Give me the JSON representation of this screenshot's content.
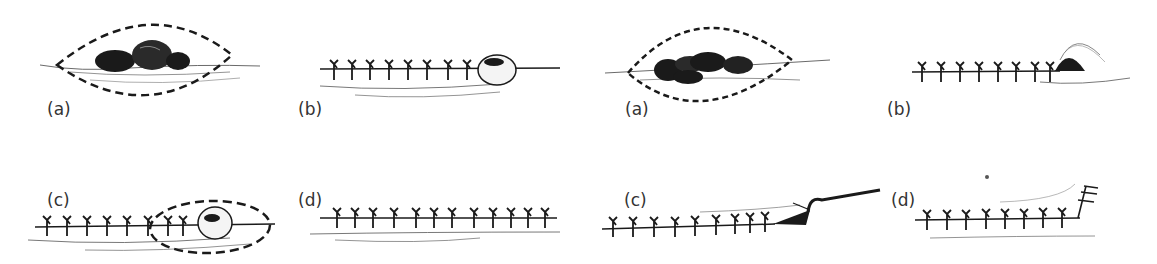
{
  "figure": {
    "sets": [
      {
        "name": "left-series",
        "panels": [
          {
            "id": "a",
            "label": "(a)",
            "description": "Dark lobulated mass with dashed elliptical excision outline"
          },
          {
            "id": "b",
            "label": "(b)",
            "description": "Row of interrupted sutures ending at rounded swelling"
          },
          {
            "id": "c",
            "label": "(c)",
            "description": "Sutured line with dashed excision outline around swelling"
          },
          {
            "id": "d",
            "label": "(d)",
            "description": "Completed straight row of sutures"
          }
        ]
      },
      {
        "name": "right-series",
        "panels": [
          {
            "id": "a",
            "label": "(a)",
            "description": "Dark lobulated mass with dashed elliptical excision outline"
          },
          {
            "id": "b",
            "label": "(b)",
            "description": "Row of sutures ending at raised dog-ear"
          },
          {
            "id": "c",
            "label": "(c)",
            "description": "Skin hook lifting end of suture line"
          },
          {
            "id": "d",
            "label": "(d)",
            "description": "Suture line with angled closure at end"
          }
        ]
      }
    ],
    "colors": {
      "ink": "#1a1a1a",
      "background": "#ffffff",
      "label": "#333333"
    }
  }
}
